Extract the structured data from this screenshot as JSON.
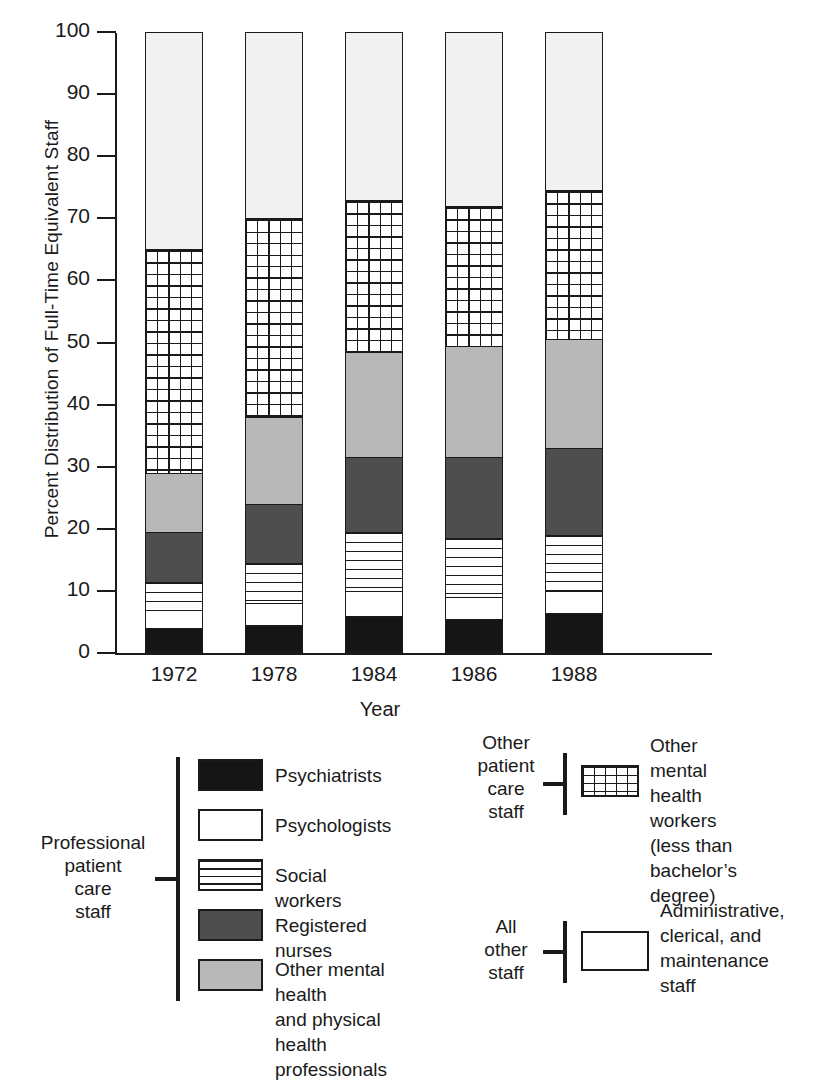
{
  "chart_data": {
    "type": "bar",
    "subtype": "stacked-percent",
    "title": "",
    "xlabel": "Year",
    "ylabel": "Percent Distribution of Full-Time Equivalent Staff",
    "categories": [
      "1972",
      "1978",
      "1984",
      "1986",
      "1988"
    ],
    "ylim": [
      0,
      100
    ],
    "yticks": [
      0,
      10,
      20,
      30,
      40,
      50,
      60,
      70,
      80,
      90,
      100
    ],
    "ytick_labels": [
      "0",
      "10",
      "20",
      "30",
      "40",
      "50",
      "60",
      "70",
      "80",
      "90",
      "100"
    ],
    "grid": false,
    "legend_position": "below-chart",
    "series": [
      {
        "name": "Psychiatrists",
        "fill": "solid-black",
        "color": "#151515",
        "values": [
          4.0,
          4.5,
          6.0,
          5.5,
          6.5
        ]
      },
      {
        "name": "Psychologists",
        "fill": "white",
        "color": "#ffffff",
        "values": [
          3.0,
          3.5,
          4.0,
          3.5,
          3.5
        ]
      },
      {
        "name": "Social workers",
        "fill": "horizontal-lines",
        "color": "#ffffff",
        "values": [
          4.5,
          6.5,
          9.5,
          9.5,
          9.0
        ]
      },
      {
        "name": "Registered nurses",
        "fill": "dark-gray",
        "color": "#4e4e4e",
        "values": [
          8.0,
          9.5,
          12.0,
          13.0,
          14.0
        ]
      },
      {
        "name": "Other mental health and physical health professionals",
        "fill": "light-gray",
        "color": "#b8b8b8",
        "values": [
          9.5,
          14.0,
          17.0,
          18.0,
          17.5
        ]
      },
      {
        "name": "Other mental health workers (less than bachelor's degree)",
        "fill": "cross-hatch-grid",
        "color": "#ffffff",
        "values": [
          36.0,
          32.0,
          24.5,
          22.5,
          24.0
        ]
      },
      {
        "name": "Administrative, clerical, and maintenance staff",
        "fill": "white-light",
        "color": "#f1f1f1",
        "values": [
          35.0,
          30.0,
          27.0,
          28.0,
          25.5
        ]
      }
    ],
    "cumulative_tops": {
      "1972": [
        4.0,
        7.0,
        11.5,
        19.5,
        29.0,
        65.0,
        100.0
      ],
      "1978": [
        4.5,
        8.0,
        14.5,
        24.0,
        38.0,
        70.0,
        100.0
      ],
      "1984": [
        6.0,
        10.0,
        19.5,
        31.5,
        48.5,
        73.0,
        100.0
      ],
      "1986": [
        5.5,
        9.0,
        18.5,
        31.5,
        49.5,
        72.0,
        100.0
      ],
      "1988": [
        6.5,
        10.0,
        19.0,
        33.0,
        50.5,
        74.5,
        100.0
      ]
    }
  },
  "axes": {
    "y_title": "Percent Distribution of Full-Time Equivalent Staff",
    "x_title": "Year"
  },
  "legend_groups": [
    {
      "id": "professional-patient-care-staff",
      "group_label": "Professional\npatient\ncare\nstaff",
      "group_label_lines": [
        "Professional",
        "patient",
        "care",
        "staff"
      ],
      "items": [
        {
          "swatch": "s-psychiatrists",
          "label_lines": [
            "Psychiatrists"
          ]
        },
        {
          "swatch": "s-psychologists",
          "label_lines": [
            "Psychologists"
          ]
        },
        {
          "swatch": "s-social",
          "label_lines": [
            "Social workers"
          ]
        },
        {
          "swatch": "s-nurses",
          "label_lines": [
            "Registered nurses"
          ]
        },
        {
          "swatch": "s-othermh",
          "label_lines": [
            "Other mental health",
            "and physical health",
            "professionals"
          ]
        }
      ]
    },
    {
      "id": "other-patient-care-staff",
      "group_label_lines": [
        "Other",
        "patient",
        "care",
        "staff"
      ],
      "items": [
        {
          "swatch": "s-grid",
          "label_lines": [
            "Other mental",
            "health workers",
            "(less than bachelor’s",
            "degree)"
          ]
        }
      ]
    },
    {
      "id": "all-other-staff",
      "group_label_lines": [
        "All",
        "other",
        "staff"
      ],
      "items": [
        {
          "swatch": "s-admin",
          "label_lines": [
            "Administrative,",
            "clerical, and",
            "maintenance",
            "staff"
          ]
        }
      ]
    }
  ],
  "legend_text": {
    "g1_l1": "Professional",
    "g1_l2": "patient",
    "g1_l3": "care",
    "g1_l4": "staff",
    "i1": "Psychiatrists",
    "i2": "Psychologists",
    "i3": "Social workers",
    "i4": "Registered nurses",
    "i5a": "Other mental health",
    "i5b": "and physical health",
    "i5c": "professionals",
    "g2_l1": "Other",
    "g2_l2": "patient",
    "g2_l3": "care",
    "g2_l4": "staff",
    "i6a": "Other mental",
    "i6b": "health workers",
    "i6c": "(less than bachelor’s",
    "i6d": "degree)",
    "g3_l1": "All",
    "g3_l2": "other",
    "g3_l3": "staff",
    "i7a": "Administrative,",
    "i7b": "clerical, and",
    "i7c": "maintenance",
    "i7d": "staff"
  },
  "colors": {
    "ink": "#1a1a1a",
    "psychiatrists": "#151515",
    "nurses": "#4e4e4e",
    "other_mh": "#b8b8b8",
    "admin": "#f1f1f1"
  }
}
